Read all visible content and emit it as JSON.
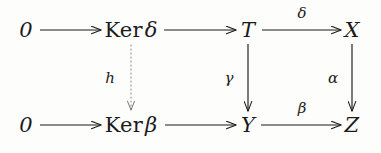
{
  "diagram": {
    "kind": "commutative-diagram",
    "background_color": "#fdfdfc",
    "ink_color": "#1b1b1b",
    "nodes": [
      {
        "id": "zero-top",
        "text": "0",
        "op": "",
        "greek": "",
        "x": 26,
        "y": 30
      },
      {
        "id": "ker-delta",
        "text": "Ker δ",
        "op": "Ker",
        "greek": "δ",
        "x": 131,
        "y": 30
      },
      {
        "id": "t",
        "text": "T",
        "op": "",
        "greek": "",
        "x": 248,
        "y": 30
      },
      {
        "id": "x",
        "text": "X",
        "op": "",
        "greek": "",
        "x": 352,
        "y": 30
      },
      {
        "id": "zero-bot",
        "text": "0",
        "op": "",
        "greek": "",
        "x": 26,
        "y": 125
      },
      {
        "id": "ker-beta",
        "text": "Ker β",
        "op": "Ker",
        "greek": "β",
        "x": 131,
        "y": 125
      },
      {
        "id": "y",
        "text": "Y",
        "op": "",
        "greek": "",
        "x": 248,
        "y": 125
      },
      {
        "id": "z",
        "text": "Z",
        "op": "",
        "greek": "",
        "x": 352,
        "y": 125
      }
    ],
    "edge_labels": [
      {
        "id": "label-delta",
        "text": "δ",
        "x": 302,
        "y": 13,
        "for": "T to X"
      },
      {
        "id": "label-beta",
        "text": "β",
        "x": 302,
        "y": 108,
        "for": "Y to Z"
      },
      {
        "id": "label-h",
        "text": "h",
        "x": 110,
        "y": 78,
        "for": "Ker delta to Ker beta"
      },
      {
        "id": "label-gamma",
        "text": "γ",
        "x": 229,
        "y": 78,
        "for": "T to Y"
      },
      {
        "id": "label-alpha",
        "text": "α",
        "x": 333,
        "y": 78,
        "for": "X to Z"
      }
    ],
    "edges": [
      {
        "id": "edge-zero-top-to-ker-delta",
        "style": "solid",
        "orientation": "horizontal",
        "from": "0",
        "to": "Ker δ"
      },
      {
        "id": "edge-ker-delta-to-t",
        "style": "solid",
        "orientation": "horizontal",
        "from": "Ker δ",
        "to": "T"
      },
      {
        "id": "edge-t-to-x",
        "style": "solid",
        "orientation": "horizontal",
        "from": "T",
        "to": "X",
        "label": "δ"
      },
      {
        "id": "edge-zero-bot-to-ker-beta",
        "style": "solid",
        "orientation": "horizontal",
        "from": "0",
        "to": "Ker β"
      },
      {
        "id": "edge-ker-beta-to-y",
        "style": "solid",
        "orientation": "horizontal",
        "from": "Ker β",
        "to": "Y"
      },
      {
        "id": "edge-y-to-z",
        "style": "solid",
        "orientation": "horizontal",
        "from": "Y",
        "to": "Z",
        "label": "β"
      },
      {
        "id": "edge-ker-delta-to-ker-beta",
        "style": "dotted",
        "orientation": "vertical",
        "from": "Ker δ",
        "to": "Ker β",
        "label": "h"
      },
      {
        "id": "edge-t-to-y",
        "style": "solid",
        "orientation": "vertical",
        "from": "T",
        "to": "Y",
        "label": "γ"
      },
      {
        "id": "edge-x-to-z",
        "style": "solid",
        "orientation": "vertical",
        "from": "X",
        "to": "Z",
        "label": "α"
      }
    ]
  }
}
